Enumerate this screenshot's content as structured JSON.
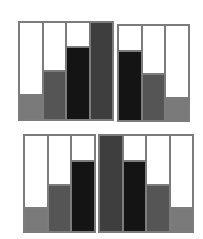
{
  "colors": {
    "border": "#7c7c7c",
    "background": "#ffffff",
    "light": "#7a7a7a",
    "mid": "#555555",
    "black": "#141414",
    "dark": "#3e3e3e"
  },
  "panels": [
    {
      "id": "top-left",
      "box": {
        "left": 18,
        "top": 21,
        "width": 96,
        "height": 100
      },
      "columns": [
        {
          "level": 0.26,
          "tone": "light"
        },
        {
          "level": 0.51,
          "tone": "mid"
        },
        {
          "level": 0.76,
          "tone": "black"
        },
        {
          "level": 1.0,
          "tone": "dark"
        }
      ]
    },
    {
      "id": "top-right",
      "box": {
        "left": 117,
        "top": 24,
        "width": 73,
        "height": 98
      },
      "columns": [
        {
          "level": 0.75,
          "tone": "black"
        },
        {
          "level": 0.5,
          "tone": "mid"
        },
        {
          "level": 0.24,
          "tone": "light"
        }
      ]
    },
    {
      "id": "bottom-left",
      "box": {
        "left": 23,
        "top": 134,
        "width": 73,
        "height": 99
      },
      "columns": [
        {
          "level": 0.25,
          "tone": "light"
        },
        {
          "level": 0.5,
          "tone": "mid"
        },
        {
          "level": 0.75,
          "tone": "black"
        }
      ]
    },
    {
      "id": "bottom-right",
      "box": {
        "left": 98,
        "top": 134,
        "width": 96,
        "height": 99
      },
      "columns": [
        {
          "level": 1.0,
          "tone": "dark"
        },
        {
          "level": 0.75,
          "tone": "black"
        },
        {
          "level": 0.5,
          "tone": "mid"
        },
        {
          "level": 0.25,
          "tone": "light"
        }
      ]
    }
  ]
}
